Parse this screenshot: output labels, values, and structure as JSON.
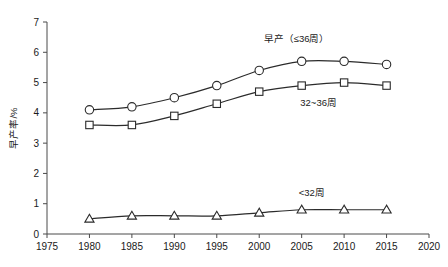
{
  "chart_data": {
    "type": "line",
    "title": "",
    "xlabel": "",
    "ylabel": "早产率/%",
    "xlim": [
      1975,
      2020
    ],
    "ylim": [
      0,
      7
    ],
    "grid": false,
    "legend_position": "inline-annotations",
    "x": [
      1980,
      1985,
      1990,
      1995,
      2000,
      2005,
      2010,
      2015
    ],
    "xticks": [
      "1975",
      "1980",
      "1985",
      "1990",
      "1995",
      "2000",
      "2005",
      "2010",
      "2015",
      "2020"
    ],
    "xtick_values": [
      1975,
      1980,
      1985,
      1990,
      1995,
      2000,
      2005,
      2010,
      2015,
      2020
    ],
    "yticks": [
      "0",
      "1",
      "2",
      "3",
      "4",
      "5",
      "6",
      "7"
    ],
    "ytick_values": [
      0,
      1,
      2,
      3,
      4,
      5,
      6,
      7
    ],
    "series": [
      {
        "name": "早产（≤36周）",
        "marker": "circle",
        "values": [
          4.1,
          4.2,
          4.5,
          4.9,
          5.4,
          5.7,
          5.7,
          5.6
        ]
      },
      {
        "name": "32~36周",
        "marker": "square",
        "values": [
          3.6,
          3.6,
          3.9,
          4.3,
          4.7,
          4.9,
          5.0,
          4.9
        ]
      },
      {
        "name": "<32周",
        "marker": "triangle",
        "values": [
          0.5,
          0.6,
          0.6,
          0.6,
          0.7,
          0.8,
          0.8,
          0.8
        ]
      }
    ],
    "annotations": [
      {
        "text": "早产（≤36周）",
        "x": 2004.4,
        "y": 6.33
      },
      {
        "text": "32~36周",
        "x": 2007.0,
        "y": 4.24
      },
      {
        "text": "<32周",
        "x": 2006.2,
        "y": 1.25
      }
    ]
  },
  "colors": {
    "line": "#2b2b2b",
    "axis": "#4a4a4a",
    "marker_fill": "#ffffff",
    "text": "#1a1a1a",
    "background": "#ffffff"
  }
}
